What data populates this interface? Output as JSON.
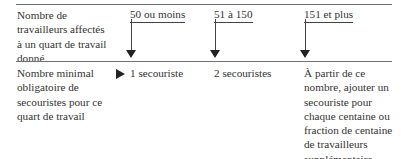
{
  "table": {
    "row1": {
      "label": "Nombre de\ntravailleurs affectés\nà un quart de travail\ndonné",
      "columns": [
        {
          "header": "50 ou moins"
        },
        {
          "header": "51 à 150"
        },
        {
          "header": "151 et plus"
        }
      ]
    },
    "row2": {
      "label": "Nombre minimal\nobligatoire de\nsecouristes pour ce\nquart de travail",
      "values": [
        "1 secouriste",
        "2 secouristes",
        "À partir de ce\nnombre, ajouter un\nsecouriste pour\nchaque centaine ou\nfraction de centaine\nde travailleurs\nsupplémentaire"
      ]
    }
  },
  "icons": {
    "row_pointer": "right-triangle-icon",
    "column_arrow": "down-arrow-icon"
  },
  "colors": {
    "text": "#333333",
    "rule": "#6f6f6f",
    "arrow": "#222222"
  }
}
